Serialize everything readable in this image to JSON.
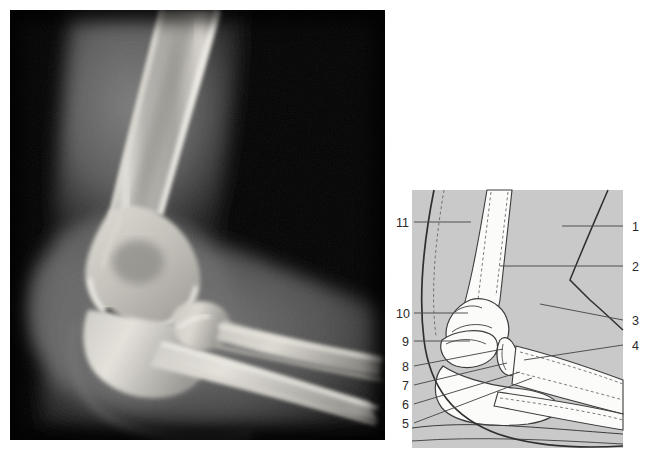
{
  "figure": {
    "panel_count": 2
  },
  "radiograph": {
    "name": "lateral-elbow-radiograph",
    "modality": "X-ray",
    "projection": "lateral",
    "region": "elbow",
    "background_color": "#000000",
    "bone_color": "#e8e6e0",
    "soft_tissue_color": "#6a6a6a"
  },
  "diagram": {
    "name": "elbow-line-diagram",
    "panel_background": "#c9c9c9",
    "bone_fill": "#fbfbfa",
    "outline_color": "#3c3c3c",
    "dashed_color": "#6e6e6e",
    "leader_color": "#4a4a4a",
    "labels_left": [
      {
        "number": "11",
        "x": 400,
        "y": 222
      },
      {
        "number": "10",
        "x": 400,
        "y": 313
      },
      {
        "number": "9",
        "x": 404,
        "y": 341
      },
      {
        "number": "8",
        "x": 404,
        "y": 366
      },
      {
        "number": "7",
        "x": 404,
        "y": 385
      },
      {
        "number": "6",
        "x": 404,
        "y": 404
      },
      {
        "number": "5",
        "x": 404,
        "y": 423
      }
    ],
    "labels_right": [
      {
        "number": "1",
        "x": 635,
        "y": 226
      },
      {
        "number": "2",
        "x": 635,
        "y": 266
      },
      {
        "number": "3",
        "x": 635,
        "y": 320
      },
      {
        "number": "4",
        "x": 635,
        "y": 345
      }
    ]
  },
  "compass": {
    "name": "orientation-compass",
    "background_color": "#c9c9c9",
    "disc_color": "#f2f2f2",
    "top": "S",
    "bottom": "I",
    "left": "P",
    "right": "A"
  }
}
